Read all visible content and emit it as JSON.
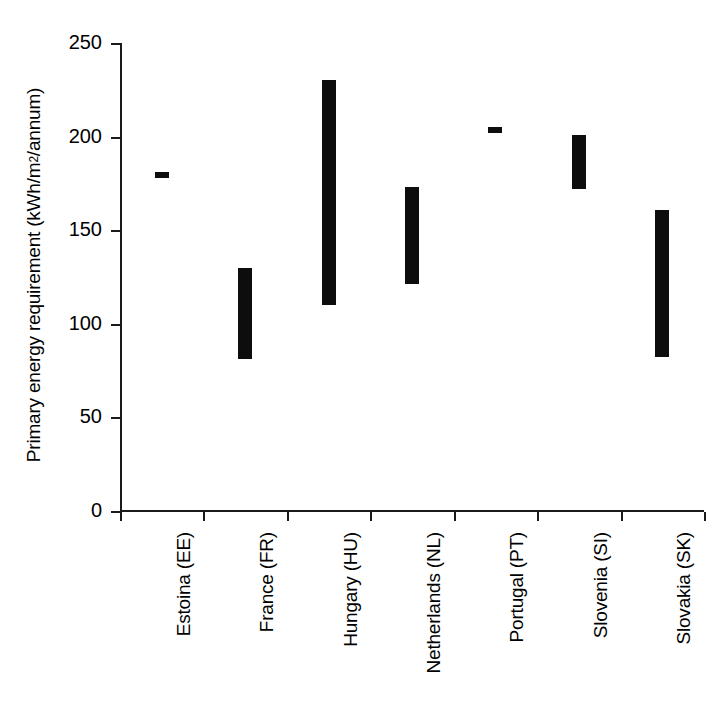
{
  "chart_data": {
    "type": "bar",
    "title": "",
    "subtitle": "",
    "xlabel": "",
    "ylabel": "Primary energy requirement (kWh/m2/annum)",
    "ylabel_prefix": "Primary energy requirement (kWh/m",
    "ylabel_superscript": "2",
    "ylabel_suffix": "/annum)",
    "categories": [
      "Estoina (EE)",
      "France (FR)",
      "Hungary (HU)",
      "Netherlands (NL)",
      "Portugal (PT)",
      "Slovenia (SI)",
      "Slovakia (SK)"
    ],
    "series": [
      {
        "name": "Primary energy requirement range",
        "low": [
          178,
          81,
          110,
          121,
          203,
          172,
          82
        ],
        "high": [
          181,
          130,
          230,
          173,
          205,
          201,
          161
        ]
      }
    ],
    "ylim": [
      0,
      250
    ],
    "yticks": [
      0,
      50,
      100,
      150,
      200,
      250
    ],
    "ytick_labels": [
      "0",
      "50",
      "100",
      "150",
      "200",
      "250"
    ],
    "grid": false,
    "legend": false,
    "bar_color": "#0d0d0d",
    "axis_color": "#1a1a1a",
    "background_color": "#ffffff"
  }
}
